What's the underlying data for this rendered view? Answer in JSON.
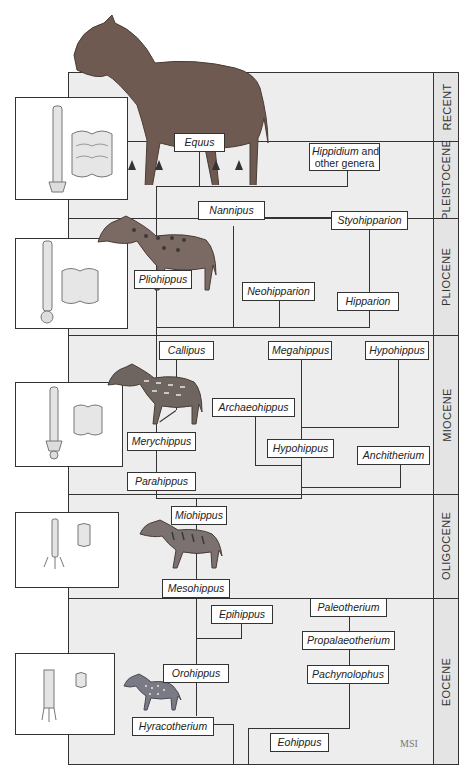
{
  "diagram": {
    "epochs": [
      {
        "label": "RECENT",
        "top": 72,
        "bottom": 141
      },
      {
        "label": "PLEISTOCENE",
        "top": 141,
        "bottom": 218
      },
      {
        "label": "PLIOCENE",
        "top": 218,
        "bottom": 335
      },
      {
        "label": "MIOCENE",
        "top": 335,
        "bottom": 494
      },
      {
        "label": "OLIGOCENE",
        "top": 494,
        "bottom": 598
      },
      {
        "label": "EOCENE",
        "top": 598,
        "bottom": 765
      }
    ],
    "taxa": {
      "equus": "Equus",
      "hippidium_italic": "Hippidium",
      "hippidium_rest1": " and",
      "hippidium_rest2": "other genera",
      "nannipus": "Nannipus",
      "styohipparion": "Styohipparion",
      "pliohippus": "Pliohippus",
      "neohipparion": "Neohipparion",
      "hipparion": "Hipparion",
      "callipus": "Callipus",
      "megahippus": "Megahippus",
      "hypohippus_top": "Hypohippus",
      "archaeohippus": "Archaeohippus",
      "merychippus": "Merychippus",
      "hypohippus_mid": "Hypohippus",
      "anchitherium": "Anchitherium",
      "parahippus": "Parahippus",
      "miohippus": "Miohippus",
      "mesohippus": "Mesohippus",
      "epihippus": "Epihippus",
      "paleotherium": "Paleotherium",
      "propalaeotherium": "Propalaeotherium",
      "orohippus": "Orohippus",
      "pachynolophus": "Pachynolophus",
      "hyracotherium": "Hyracotherium",
      "eohippus": "Eohippus"
    },
    "insets": [
      {
        "epoch": "Pleistocene",
        "content": "foot bone and molar tooth"
      },
      {
        "epoch": "Pliocene",
        "content": "foot bone and molar tooth"
      },
      {
        "epoch": "Miocene",
        "content": "foot bone and molar tooth"
      },
      {
        "epoch": "Oligocene",
        "content": "foot bone and molar tooth"
      },
      {
        "epoch": "Eocene",
        "content": "foot bone and molar tooth"
      }
    ],
    "signature": "MSI",
    "colors": {
      "frame": "#ededed",
      "line": "#333333",
      "box": "#ffffff",
      "horse": "#6e5a50"
    }
  }
}
